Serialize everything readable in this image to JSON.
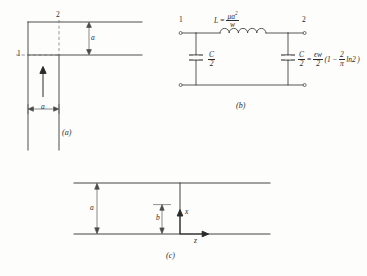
{
  "figure": {
    "parts": [
      {
        "id": "a",
        "caption": "(a)"
      },
      {
        "id": "b",
        "caption": "(b)"
      },
      {
        "id": "c",
        "caption": "(c)"
      }
    ]
  },
  "part_a": {
    "caption": "(a)",
    "port_1": "1",
    "port_2": "2",
    "dim_vertical": "a",
    "dim_horizontal": "a",
    "field_arrow": "field-direction-arrow"
  },
  "part_b": {
    "caption": "(b)",
    "port_1": "1",
    "port_2": "2",
    "inductor_label": {
      "symbol": "L",
      "equals": "=",
      "numerator": "μa",
      "numerator_exponent": "2",
      "denominator": "w"
    },
    "cap_left": {
      "numerator": "C",
      "denominator": "2"
    },
    "cap_right": {
      "numerator": "C",
      "denominator": "2"
    },
    "cap_formula": {
      "equals": "=",
      "numerator": "ϵw",
      "denominator": "2",
      "paren_open": "(1",
      "minus": "−",
      "frac_num": "2",
      "frac_den": "π",
      "ln_term": "ln2",
      "paren_close": ")"
    }
  },
  "part_c": {
    "caption": "(c)",
    "dim_a": "a",
    "dim_b": "b",
    "axis_x": "x",
    "axis_z": "z"
  },
  "colors": {
    "ink": "#2a2a2a",
    "line": "#3a3a3a",
    "paper": "#fdfdfc"
  }
}
